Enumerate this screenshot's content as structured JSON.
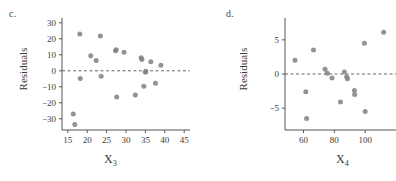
{
  "figure": {
    "background": "#ffffff",
    "point_color": "#808080",
    "axis_color": "#555555",
    "zero_line_color": "#666666",
    "panels": [
      "c",
      "d"
    ]
  },
  "panel_c": {
    "label": "c.",
    "ylabel": "Residuals",
    "xlabel_base": "X",
    "xlabel_sub": "3"
  },
  "panel_d": {
    "label": "d.",
    "ylabel": "Residuals",
    "xlabel_base": "X",
    "xlabel_sub": "4"
  },
  "chart_data": [
    {
      "type": "scatter",
      "panel": "c",
      "title": "c.",
      "xlabel": "X3",
      "ylabel": "Residuals",
      "xlim": [
        13.5,
        46.5
      ],
      "ylim": [
        -37,
        33
      ],
      "xticks": [
        15,
        20,
        25,
        30,
        35,
        40,
        45
      ],
      "yticks": [
        30,
        20,
        10,
        0,
        -10,
        -20,
        -30
      ],
      "grid": false,
      "legend": null,
      "annotations": [
        {
          "type": "hline",
          "y": 0,
          "style": "dashed"
        }
      ],
      "points": [
        {
          "x": 16.4,
          "y": -27.0
        },
        {
          "x": 16.8,
          "y": -33.5
        },
        {
          "x": 18.1,
          "y": 23.0
        },
        {
          "x": 18.2,
          "y": -4.8
        },
        {
          "x": 20.9,
          "y": 9.4
        },
        {
          "x": 22.3,
          "y": 6.5
        },
        {
          "x": 23.4,
          "y": 21.7
        },
        {
          "x": 23.6,
          "y": -3.4
        },
        {
          "x": 27.3,
          "y": 12.6
        },
        {
          "x": 27.5,
          "y": 13.2
        },
        {
          "x": 27.6,
          "y": -16.4
        },
        {
          "x": 29.5,
          "y": 11.6
        },
        {
          "x": 32.4,
          "y": -15.2
        },
        {
          "x": 33.9,
          "y": 8.1
        },
        {
          "x": 34.1,
          "y": 7.0
        },
        {
          "x": 34.6,
          "y": -9.7
        },
        {
          "x": 35.0,
          "y": -0.9
        },
        {
          "x": 35.1,
          "y": -0.3
        },
        {
          "x": 36.4,
          "y": 5.6
        },
        {
          "x": 37.6,
          "y": -7.8
        },
        {
          "x": 39.0,
          "y": 3.5
        }
      ]
    },
    {
      "type": "scatter",
      "panel": "d",
      "title": "d.",
      "xlabel": "X4",
      "ylabel": "Residuals",
      "xlim": [
        48,
        120
      ],
      "ylim": [
        -8.2,
        8.2
      ],
      "xticks": [
        60,
        80,
        100
      ],
      "yticks": [
        5,
        0,
        -5
      ],
      "grid": false,
      "legend": null,
      "annotations": [
        {
          "type": "hline",
          "y": 0,
          "style": "dashed"
        }
      ],
      "points": [
        {
          "x": 54.5,
          "y": 2.0
        },
        {
          "x": 61.5,
          "y": -2.6
        },
        {
          "x": 62.0,
          "y": -6.5
        },
        {
          "x": 66.5,
          "y": 3.5
        },
        {
          "x": 74.0,
          "y": 0.7
        },
        {
          "x": 75.5,
          "y": 0.1
        },
        {
          "x": 78.5,
          "y": -0.6
        },
        {
          "x": 84.0,
          "y": -4.1
        },
        {
          "x": 86.5,
          "y": 0.3
        },
        {
          "x": 88.0,
          "y": -0.4
        },
        {
          "x": 88.5,
          "y": -0.7
        },
        {
          "x": 93.0,
          "y": -2.4
        },
        {
          "x": 93.2,
          "y": -3.0
        },
        {
          "x": 99.5,
          "y": 4.5
        },
        {
          "x": 100.0,
          "y": -5.5
        },
        {
          "x": 112.0,
          "y": 6.1
        }
      ]
    }
  ]
}
